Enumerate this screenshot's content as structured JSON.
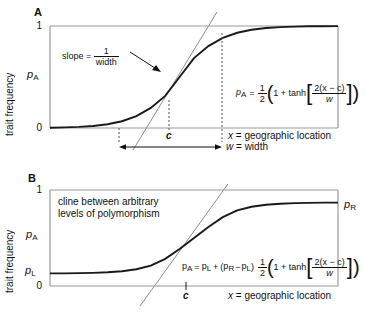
{
  "figure": {
    "type": "two-panel-line-chart",
    "background": "#ffffff",
    "curve_color": "#1a1a1a",
    "frame_color": "#9a9a9a",
    "tangent_color": "#8d8d8d",
    "dash_color": "#555555"
  },
  "panel_a": {
    "label": "A",
    "ylabel": "trait frequency",
    "y_ticks": [
      "1",
      "0"
    ],
    "y_series_label": "p",
    "y_series_sub": "A",
    "xlabel_prefix": "x",
    "xlabel_text": " = geographic location",
    "center_label": "c",
    "width_label_var": "w",
    "width_label_text": " = width",
    "slope_text": "slope = ",
    "slope_num": "1",
    "slope_den": "width",
    "equation": {
      "lhs_var": "p",
      "lhs_sub": "A",
      "eq": "=",
      "half_num": "1",
      "half_den": "2",
      "open": "(",
      "one_plus": "1 + tanh",
      "frac_num": "2(x − c)",
      "frac_den": "w",
      "close": ")"
    }
  },
  "panel_b": {
    "label": "B",
    "ylabel": "trait frequency",
    "y_ticks": [
      "1",
      "0"
    ],
    "y_series_label": "p",
    "y_series_sub": "A",
    "left_level_var": "p",
    "left_level_sub": "L",
    "right_level_var": "p",
    "right_level_sub": "R",
    "caption_line1": "cline between arbitrary",
    "caption_line2": "levels of polymorphism",
    "xlabel_prefix": "x",
    "xlabel_text": " = geographic location",
    "center_label": "c",
    "equation": {
      "lhs_var": "p",
      "lhs_sub": "A",
      "eq": "=",
      "pl_var": "p",
      "pl_sub": "L",
      "plus": "+",
      "open_paren": "(",
      "pr_var": "p",
      "pr_sub": "R",
      "minus": "−",
      "pl2_var": "p",
      "pl2_sub": "L",
      "close_paren": ")",
      "half_num": "1",
      "half_den": "2",
      "open": "(",
      "one_plus": "1 + tanh",
      "frac_num": "2(x − c)",
      "frac_den": "w",
      "close": ")"
    }
  },
  "chart_data": {
    "type": "line",
    "title": "",
    "panels": [
      {
        "name": "A",
        "xlabel": "x = geographic location",
        "ylabel": "trait frequency",
        "ylim": [
          0,
          1
        ],
        "yticks": [
          0,
          1
        ],
        "series_name": "pA",
        "formula": "pA = 1/2 (1 + tanh[2(x-c)/w])",
        "center_c": 0.45,
        "width_w": 0.42,
        "p_left": 0.0,
        "p_right": 1.0,
        "x": [
          0.0,
          0.05,
          0.1,
          0.15,
          0.2,
          0.25,
          0.3,
          0.35,
          0.4,
          0.45,
          0.5,
          0.55,
          0.6,
          0.65,
          0.7,
          0.75,
          0.8,
          0.85,
          0.9,
          0.95,
          1.0
        ],
        "y": [
          0.003,
          0.006,
          0.011,
          0.02,
          0.037,
          0.066,
          0.116,
          0.197,
          0.315,
          0.5,
          0.685,
          0.803,
          0.884,
          0.934,
          0.963,
          0.98,
          0.989,
          0.994,
          0.997,
          0.998,
          0.999
        ],
        "tangent_slope_label": "slope = 1/width",
        "markers": {
          "c": 0.45,
          "w_start": 0.24,
          "w_end": 0.66
        }
      },
      {
        "name": "B",
        "xlabel": "x = geographic location",
        "ylabel": "trait frequency",
        "ylim": [
          0,
          1
        ],
        "yticks": [
          0,
          1
        ],
        "series_name": "pA",
        "formula": "pA = pL + (pR - pL) 1/2 (1 + tanh[2(x-c)/w])",
        "center_c": 0.5,
        "width_w": 0.34,
        "p_left": 0.13,
        "p_right": 0.87,
        "x": [
          0.0,
          0.05,
          0.1,
          0.15,
          0.2,
          0.25,
          0.3,
          0.35,
          0.4,
          0.45,
          0.5,
          0.55,
          0.6,
          0.65,
          0.7,
          0.75,
          0.8,
          0.85,
          0.9,
          0.95,
          1.0
        ],
        "y": [
          0.131,
          0.132,
          0.134,
          0.137,
          0.143,
          0.154,
          0.175,
          0.213,
          0.283,
          0.385,
          0.5,
          0.615,
          0.717,
          0.787,
          0.825,
          0.846,
          0.857,
          0.863,
          0.866,
          0.868,
          0.869
        ],
        "markers": {
          "c": 0.5
        }
      }
    ]
  }
}
